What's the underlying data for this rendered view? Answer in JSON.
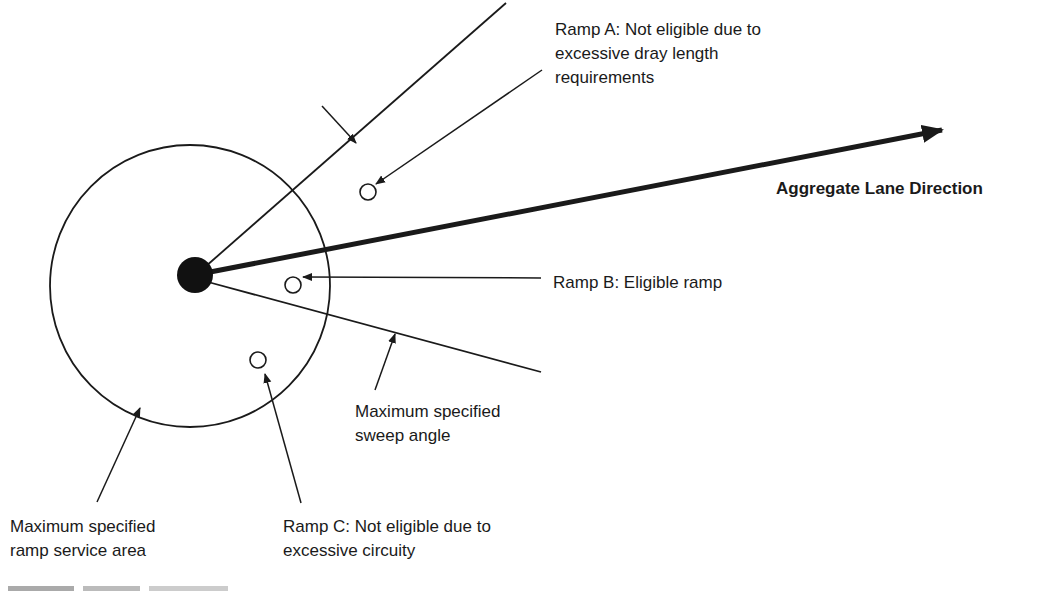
{
  "diagram": {
    "labels": {
      "ramp_a": [
        "Ramp A: Not eligible due to",
        "excessive dray length",
        "requirements"
      ],
      "aggregate_lane": "Aggregate Lane Direction",
      "ramp_b": "Ramp B: Eligible ramp",
      "sweep_angle": [
        "Maximum specified",
        "sweep angle"
      ],
      "service_area": [
        "Maximum specified",
        "ramp service area"
      ],
      "ramp_c": [
        "Ramp C: Not eligible due to",
        "excessive circuity"
      ]
    },
    "colors": {
      "ink": "#1a1a1a",
      "background": "#ffffff"
    }
  }
}
